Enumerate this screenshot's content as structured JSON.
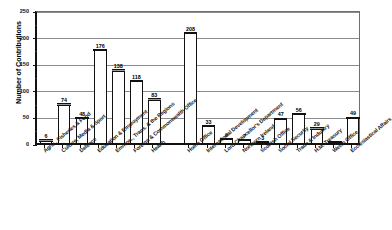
{
  "title_faint": "",
  "axis": {
    "y_title": "Number of Contributions",
    "y_ticks": [
      "0",
      "50",
      "100",
      "150",
      "200",
      "250"
    ]
  },
  "chart_data": {
    "type": "bar",
    "title": "",
    "xlabel": "",
    "ylabel": "Number of Contributions",
    "ylim": [
      0,
      250
    ],
    "ytick_values": [
      0,
      50,
      100,
      150,
      200,
      250
    ],
    "grid": true,
    "legend": "none",
    "orientation": "vertical",
    "categories": [
      "Agric., Fisheries & Food",
      "Culture, Media & Sport",
      "Defence",
      "Education & Employment",
      "Environ., Trans. & the Regions",
      "Foreign & Commonwealth Office",
      "Health",
      "Home Office",
      "International Development",
      "Lord Chancellor's Department",
      "Northern Ireland",
      "Scottish Office",
      "Social Security",
      "Trade & Industry",
      "H.M. Treasury",
      "Welsh Office",
      "Ecclesiastical Affairs"
    ],
    "values": [
      6,
      74,
      48,
      176,
      138,
      118,
      83,
      208,
      33,
      9,
      7,
      3,
      47,
      56,
      29,
      1,
      49
    ],
    "value_labels": [
      "6",
      "74",
      "48",
      "176",
      "138",
      "118",
      "83",
      "208",
      "33",
      "9",
      "7",
      "3",
      "47",
      "56",
      "29",
      "",
      "49"
    ]
  },
  "style": {
    "bar_face": "#ffffff",
    "bar_outline": "#111111",
    "bar_top_cap": "#9a9a9a",
    "gridline": "#8c8c8c",
    "text": "#000000"
  }
}
